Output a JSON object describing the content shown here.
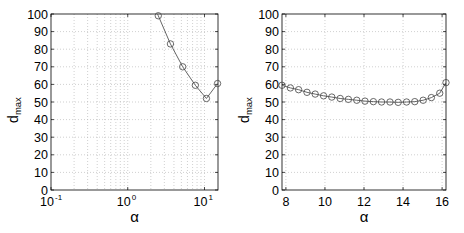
{
  "chart_data": [
    {
      "type": "line",
      "title": "",
      "xlabel": "α",
      "ylabel": "d",
      "ylabel_subscript": "max",
      "xscale": "log",
      "xlim": [
        0.1,
        15.0
      ],
      "ylim": [
        0,
        100
      ],
      "xticks": [
        0.1,
        1,
        10
      ],
      "xtick_labels": [
        {
          "base": "10",
          "exp": "-1"
        },
        {
          "base": "10",
          "exp": "0"
        },
        {
          "base": "10",
          "exp": "1"
        }
      ],
      "yticks": [
        0,
        10,
        20,
        30,
        40,
        50,
        60,
        70,
        80,
        90,
        100
      ],
      "grid": true,
      "minor_grid": true,
      "marker": "circle",
      "series": [
        {
          "name": "d_max",
          "x": [
            2.0,
            2.5,
            3.6,
            5.2,
            7.6,
            10.6,
            14.8
          ],
          "y": [
            108,
            99,
            83,
            70,
            59.5,
            52,
            60.5
          ],
          "marked": [
            false,
            true,
            true,
            true,
            true,
            true,
            true
          ]
        }
      ]
    },
    {
      "type": "line",
      "title": "",
      "xlabel": "α",
      "ylabel": "d",
      "ylabel_subscript": "max",
      "xscale": "linear",
      "xlim": [
        7.8,
        16.2
      ],
      "ylim": [
        0,
        100
      ],
      "xticks": [
        8,
        10,
        12,
        14,
        16
      ],
      "yticks": [
        0,
        10,
        20,
        30,
        40,
        50,
        60,
        70,
        80,
        90,
        100
      ],
      "grid": true,
      "marker": "circle",
      "series": [
        {
          "name": "d_max",
          "x": [
            7.8,
            8.23,
            8.65,
            9.08,
            9.5,
            9.93,
            10.35,
            10.78,
            11.2,
            11.63,
            12.05,
            12.48,
            12.9,
            13.33,
            13.75,
            14.18,
            14.6,
            15.03,
            15.45,
            15.88,
            16.2
          ],
          "y": [
            59.5,
            58,
            57,
            55.5,
            54.5,
            53.5,
            52.8,
            52,
            51.5,
            51,
            50.5,
            50.2,
            50,
            50,
            49.8,
            50,
            50.2,
            51,
            52.5,
            55,
            61
          ]
        }
      ]
    }
  ],
  "colors": {
    "line": "#555555",
    "marker": "#444444",
    "grid": "#b0b0b0",
    "axis": "#000000"
  }
}
